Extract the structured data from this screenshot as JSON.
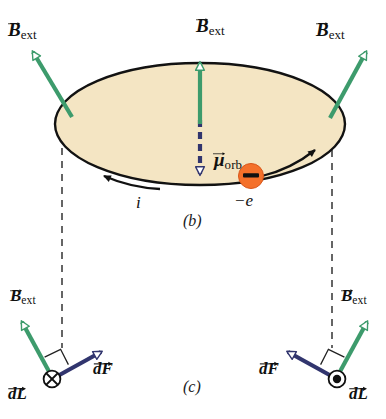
{
  "figure": {
    "panels": [
      {
        "id": "b",
        "label": "(b)"
      },
      {
        "id": "c",
        "label": "(c)"
      }
    ]
  },
  "colors": {
    "field_arrow": "#3d9b6c",
    "moment_arrow": "#31356e",
    "force_arrow": "#3b3c7a",
    "disk_fill": "#f4e5c3",
    "disk_edge": "#121212",
    "electron_fill": "#f4702a",
    "electron_bar": "#111111",
    "dashed_line": "#333333",
    "text": "#101010",
    "background": "#ffffff"
  },
  "panel_b": {
    "disk": {
      "name": "orbit-disk"
    },
    "field_labels": [
      {
        "id": "left",
        "symbol": "B",
        "subscript": "ext"
      },
      {
        "id": "center",
        "symbol": "B",
        "subscript": "ext"
      },
      {
        "id": "right",
        "symbol": "B",
        "subscript": "ext"
      }
    ],
    "moment_label": {
      "symbol": "μ",
      "subscript": "orb"
    },
    "current_label": "i",
    "electron_label": "−e",
    "electron": {
      "charge_sign": "−"
    }
  },
  "panel_c": {
    "left": {
      "field_label": {
        "symbol": "B",
        "subscript": "ext"
      },
      "force_label": {
        "symbol": "dF"
      },
      "length_label": {
        "symbol": "dL"
      },
      "current_direction": "into-page",
      "current_symbol": "⊗"
    },
    "right": {
      "field_label": {
        "symbol": "B",
        "subscript": "ext"
      },
      "force_label": {
        "symbol": "dF"
      },
      "length_label": {
        "symbol": "dL"
      },
      "current_direction": "out-of-page",
      "current_symbol": "⊙"
    }
  }
}
